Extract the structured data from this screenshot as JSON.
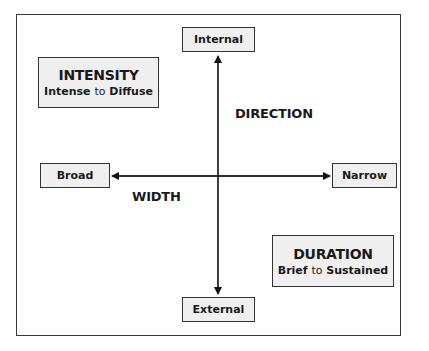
{
  "diagram": {
    "nodes": {
      "top": "Internal",
      "bottom": "External",
      "left": "Broad",
      "right": "Narrow"
    },
    "axes": {
      "vertical": "DIRECTION",
      "horizontal": "WIDTH"
    },
    "intensity": {
      "title": "INTENSITY",
      "from": "Intense",
      "connector": "to",
      "to": "Diffuse"
    },
    "duration": {
      "title": "DURATION",
      "from": "Brief",
      "connector": "to",
      "to": "Sustained"
    },
    "colors": {
      "box_fill": "#efefef",
      "stroke": "#333333"
    }
  }
}
